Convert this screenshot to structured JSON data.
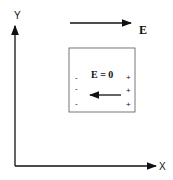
{
  "diagram": {
    "axes": {
      "x_label": "X",
      "y_label": "Y"
    },
    "external_field": {
      "label": "E",
      "direction": "right"
    },
    "conductor": {
      "interior_label": "E = 0",
      "induced_field_direction": "left",
      "left_charges": [
        "-",
        "-",
        "-"
      ],
      "right_charges": [
        "+",
        "+",
        "+"
      ]
    },
    "colors": {
      "stroke": "#111111",
      "box_border": "#555555"
    }
  }
}
